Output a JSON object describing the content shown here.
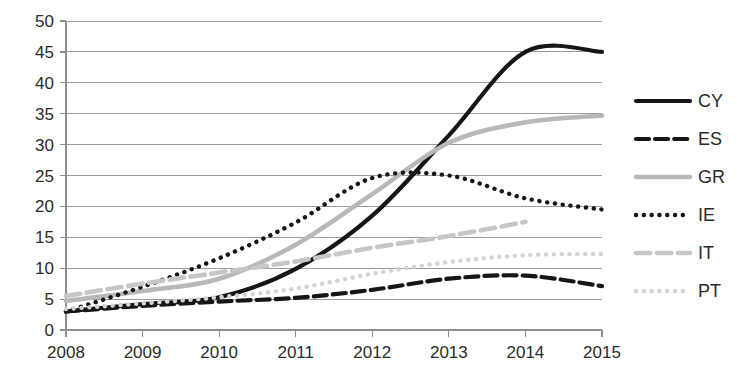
{
  "chart_data": {
    "type": "line",
    "title": "",
    "subtitle": "",
    "xlabel": "",
    "ylabel": "",
    "x": [
      "2008",
      "2009",
      "2010",
      "2011",
      "2012",
      "2013",
      "2014",
      "2015"
    ],
    "categories": [
      "2008",
      "2009",
      "2010",
      "2011",
      "2012",
      "2013",
      "2014",
      "2015"
    ],
    "ylim": [
      0,
      50
    ],
    "xlim": [
      "2008",
      "2015"
    ],
    "y_ticks": [
      0,
      5,
      10,
      15,
      20,
      25,
      30,
      35,
      40,
      45,
      50
    ],
    "x_ticks": [
      "2008",
      "2009",
      "2010",
      "2011",
      "2012",
      "2013",
      "2014",
      "2015"
    ],
    "grid": true,
    "grid_axis": "y",
    "legend_position": "right",
    "series": [
      {
        "name": "CY",
        "values": [
          3.0,
          4.2,
          5.3,
          9.9,
          18.5,
          31.5,
          45.0,
          45.0
        ],
        "color": "#161616",
        "style": "solid",
        "width": 4.2
      },
      {
        "name": "ES",
        "values": [
          3.0,
          3.9,
          4.6,
          5.2,
          6.5,
          8.3,
          8.8,
          7.1
        ],
        "color": "#161616",
        "style": "dashed",
        "width": 4.2
      },
      {
        "name": "GR",
        "values": [
          4.7,
          6.3,
          8.3,
          13.8,
          22.0,
          30.3,
          33.6,
          34.7
        ],
        "color": "#b8b8b8",
        "style": "solid",
        "width": 4.6
      },
      {
        "name": "IE",
        "values": [
          3.0,
          7.0,
          11.6,
          17.4,
          24.6,
          25.0,
          21.3,
          19.5
        ],
        "color": "#161616",
        "style": "dotted",
        "width": 4.4
      },
      {
        "name": "IT",
        "values": [
          5.5,
          7.5,
          9.3,
          11.1,
          13.3,
          15.2,
          17.5,
          null
        ],
        "color": "#c6c6c6",
        "style": "dashed",
        "width": 4.6
      },
      {
        "name": "PT",
        "values": [
          3.4,
          4.3,
          5.3,
          6.7,
          9.1,
          11.0,
          12.1,
          12.3
        ],
        "color": "#d4d4d4",
        "style": "dotted",
        "width": 4.4
      }
    ]
  },
  "legend": {
    "entries": [
      {
        "label": "CY"
      },
      {
        "label": "ES"
      },
      {
        "label": "GR"
      },
      {
        "label": "IE"
      },
      {
        "label": "IT"
      },
      {
        "label": "PT"
      }
    ]
  },
  "axes": {
    "y_tick_labels": [
      "50",
      "45",
      "40",
      "35",
      "30",
      "25",
      "20",
      "15",
      "10",
      "5",
      "0"
    ],
    "x_tick_labels": [
      "2008",
      "2009",
      "2010",
      "2011",
      "2012",
      "2013",
      "2014",
      "2015"
    ]
  }
}
